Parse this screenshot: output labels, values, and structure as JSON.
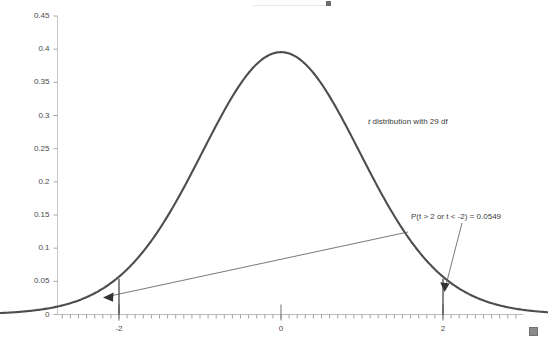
{
  "chart_data": {
    "type": "line",
    "title": "",
    "xlabel": "",
    "ylabel": "",
    "xlim": [
      -3.75,
      3.3
    ],
    "ylim": [
      0,
      0.45
    ],
    "grid": false,
    "legend": null,
    "curve": {
      "name": "t distribution with 29 df",
      "distribution": "student-t",
      "df": 29,
      "color": "#4d4d4d",
      "peak_x": 0,
      "peak_y": 0.3956,
      "x": [
        -3.75,
        -3.5,
        -3.25,
        -3.0,
        -2.75,
        -2.5,
        -2.25,
        -2.0,
        -1.75,
        -1.5,
        -1.25,
        -1.0,
        -0.75,
        -0.5,
        -0.25,
        0.0,
        0.25,
        0.5,
        0.75,
        1.0,
        1.25,
        1.5,
        1.75,
        2.0,
        2.25,
        2.5,
        2.75,
        3.0,
        3.25
      ],
      "y": [
        0.0012,
        0.0022,
        0.0039,
        0.0066,
        0.011,
        0.0177,
        0.0277,
        0.0422,
        0.0621,
        0.088,
        0.1198,
        0.1562,
        0.1945,
        0.2313,
        0.2628,
        0.2856,
        0.2628,
        0.2313,
        0.1945,
        0.1562,
        0.1198,
        0.088,
        0.0621,
        0.0422,
        0.0277,
        0.0177,
        0.011,
        0.0066,
        0.0039
      ]
    },
    "y_ticks": [
      "0",
      "0.05",
      "0.1",
      "0.15",
      "0.2",
      "0.25",
      "0.3",
      "0.35",
      "0.4",
      "0.45"
    ],
    "y_tick_values": [
      0,
      0.05,
      0.1,
      0.15,
      0.2,
      0.25,
      0.3,
      0.35,
      0.4,
      0.45
    ],
    "x_ticks": [
      "-2",
      "0",
      "2"
    ],
    "x_tick_values": [
      -2,
      0,
      2
    ],
    "x_minor_tick_spacing": 0.1,
    "markers": [
      {
        "name": "lower-critical-value",
        "x": -2,
        "label": "-2"
      },
      {
        "name": "upper-critical-value",
        "x": 2,
        "label": "2"
      }
    ],
    "annotations": [
      {
        "name": "distribution-label",
        "text": "t distribution with 29 df",
        "italic_prefix": "t",
        "rest": " distribution with 29 df",
        "x_px": 368,
        "y_px": 117
      },
      {
        "name": "probability-label",
        "text": "P(t > 2 or t < -2) = 0.0549",
        "probability": 0.0549,
        "x_px": 411,
        "y_px": 212
      }
    ]
  },
  "axes": {
    "y_axis_color": "#c9c9c9",
    "x_axis_color": "#b9b9b9",
    "tick_color": "#9a9a9a",
    "label_color": "#4a4a4a"
  },
  "canvas": {
    "background": "#ffffff",
    "width": 548,
    "height": 343
  },
  "handles": {
    "resize_handle_name": "resize-handle",
    "resize_handle_color": "#8a8a8a"
  }
}
